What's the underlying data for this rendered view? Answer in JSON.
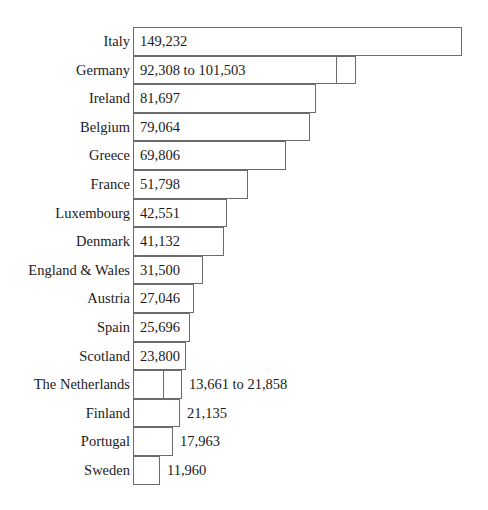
{
  "chart_data": {
    "type": "bar",
    "title": "",
    "subtitle": "",
    "xlabel": "",
    "ylabel": "",
    "orientation": "horizontal",
    "grid": false,
    "legend": null,
    "axis_visible": false,
    "xlim": [
      0,
      149232
    ],
    "categories": [
      "Italy",
      "Germany",
      "Ireland",
      "Belgium",
      "Greece",
      "France",
      "Luxembourg",
      "Denmark",
      "England & Wales",
      "Austria",
      "Spain",
      "Scotland",
      "The Netherlands",
      "Finland",
      "Portugal",
      "Sweden"
    ],
    "values": [
      149232,
      92308,
      81697,
      79064,
      69806,
      51798,
      42551,
      41132,
      31500,
      27046,
      25696,
      23800,
      13661,
      21135,
      17963,
      11960
    ],
    "value_upper": [
      null,
      101503,
      null,
      null,
      null,
      null,
      null,
      null,
      null,
      null,
      null,
      null,
      21858,
      null,
      null,
      null
    ],
    "bars": [
      {
        "label": "Italy",
        "value_text": "149,232",
        "value": 149232,
        "upper": null,
        "label_position": "inside",
        "bar_px": 329,
        "ext_px": 0
      },
      {
        "label": "Germany",
        "value_text": "92,308 to 101,503",
        "value": 92308,
        "upper": 101503,
        "label_position": "inside",
        "bar_px": 204,
        "ext_px": 19
      },
      {
        "label": "Ireland",
        "value_text": "81,697",
        "value": 81697,
        "upper": null,
        "label_position": "inside",
        "bar_px": 183,
        "ext_px": 0
      },
      {
        "label": "Belgium",
        "value_text": "79,064",
        "value": 79064,
        "upper": null,
        "label_position": "inside",
        "bar_px": 177,
        "ext_px": 0
      },
      {
        "label": "Greece",
        "value_text": "69,806",
        "value": 69806,
        "upper": null,
        "label_position": "inside",
        "bar_px": 153,
        "ext_px": 0
      },
      {
        "label": "France",
        "value_text": "51,798",
        "value": 51798,
        "upper": null,
        "label_position": "inside",
        "bar_px": 115,
        "ext_px": 0
      },
      {
        "label": "Luxembourg",
        "value_text": "42,551",
        "value": 42551,
        "upper": null,
        "label_position": "inside",
        "bar_px": 94,
        "ext_px": 0
      },
      {
        "label": "Denmark",
        "value_text": "41,132",
        "value": 41132,
        "upper": null,
        "label_position": "inside",
        "bar_px": 91,
        "ext_px": 0
      },
      {
        "label": "England & Wales",
        "value_text": "31,500",
        "value": 31500,
        "upper": null,
        "label_position": "inside",
        "bar_px": 70,
        "ext_px": 0
      },
      {
        "label": "Austria",
        "value_text": "27,046",
        "value": 27046,
        "upper": null,
        "label_position": "inside",
        "bar_px": 61,
        "ext_px": 0
      },
      {
        "label": "Spain",
        "value_text": "25,696",
        "value": 25696,
        "upper": null,
        "label_position": "inside",
        "bar_px": 57,
        "ext_px": 0
      },
      {
        "label": "Scotland",
        "value_text": "23,800",
        "value": 23800,
        "upper": null,
        "label_position": "inside",
        "bar_px": 53,
        "ext_px": 0
      },
      {
        "label": "The Netherlands",
        "value_text": "13,661 to 21,858",
        "value": 13661,
        "upper": 21858,
        "label_position": "outside",
        "bar_px": 31,
        "ext_px": 18
      },
      {
        "label": "Finland",
        "value_text": "21,135",
        "value": 21135,
        "upper": null,
        "label_position": "outside",
        "bar_px": 47,
        "ext_px": 0
      },
      {
        "label": "Portugal",
        "value_text": "17,963",
        "value": 17963,
        "upper": null,
        "label_position": "outside",
        "bar_px": 40,
        "ext_px": 0
      },
      {
        "label": "Sweden",
        "value_text": "11,960",
        "value": 11960,
        "upper": null,
        "label_position": "outside",
        "bar_px": 27,
        "ext_px": 0
      }
    ],
    "colors": {
      "bar_fill": "#ffffff",
      "bar_stroke": "#6b6b6b",
      "text": "#1b1b1b",
      "background": "#ffffff"
    }
  }
}
